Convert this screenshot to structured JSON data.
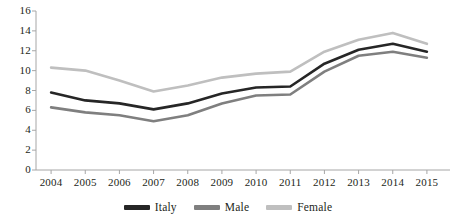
{
  "chart_data": {
    "type": "line",
    "title": "",
    "subtitle": "",
    "xlabel": "",
    "ylabel": "",
    "categories": [
      "2004",
      "2005",
      "2006",
      "2007",
      "2008",
      "2009",
      "2010",
      "2011",
      "2012",
      "2013",
      "2014",
      "2015"
    ],
    "ylim": [
      0,
      16
    ],
    "yticks": [
      "0",
      "2",
      "4",
      "6",
      "8",
      "10",
      "12",
      "14",
      "16"
    ],
    "ytick_values": [
      0,
      2,
      4,
      6,
      8,
      10,
      12,
      14,
      16
    ],
    "grid": false,
    "legend_position": "bottom",
    "series": [
      {
        "name": "Italy",
        "color": "#262626",
        "values": [
          7.8,
          7.0,
          6.7,
          6.1,
          6.7,
          7.7,
          8.3,
          8.4,
          10.7,
          12.1,
          12.7,
          11.9
        ]
      },
      {
        "name": "Male",
        "color": "#7f7f7f",
        "values": [
          6.3,
          5.8,
          5.5,
          4.9,
          5.5,
          6.7,
          7.5,
          7.6,
          9.9,
          11.5,
          11.9,
          11.3
        ]
      },
      {
        "name": "Female",
        "color": "#bfbfbf",
        "values": [
          10.3,
          10.0,
          9.0,
          7.9,
          8.5,
          9.3,
          9.7,
          9.9,
          11.9,
          13.1,
          13.8,
          12.7
        ]
      }
    ]
  },
  "axis": {
    "line_color": "#a6a6a6"
  },
  "legend": {
    "entries": [
      {
        "label": "Italy",
        "color": "#262626"
      },
      {
        "label": "Male",
        "color": "#7f7f7f"
      },
      {
        "label": "Female",
        "color": "#bfbfbf"
      }
    ]
  }
}
